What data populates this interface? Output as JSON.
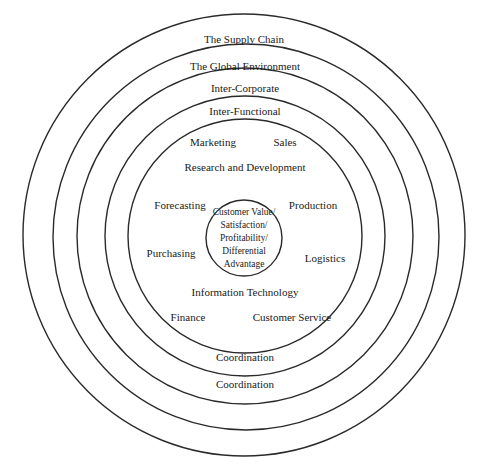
{
  "diagram": {
    "type": "concentric-circles",
    "stroke_color": "#2a2a2a",
    "rings": [
      {
        "name": "supply-chain",
        "label": "The Supply Chain",
        "cx": 244,
        "cy": 235,
        "r": 221
      },
      {
        "name": "global-environment",
        "label": "The Global Environment",
        "cx": 246,
        "cy": 237,
        "r": 193
      },
      {
        "name": "inter-corporate",
        "label": "Inter-Corporate",
        "cx": 245,
        "cy": 236,
        "r": 168
      },
      {
        "name": "inter-functional",
        "label": "Inter-Functional",
        "cx": 245,
        "cy": 236,
        "r": 140
      },
      {
        "name": "functions",
        "label": "",
        "cx": 245,
        "cy": 236,
        "r": 117
      },
      {
        "name": "core",
        "label": "",
        "cx": 244,
        "cy": 238,
        "r": 38
      }
    ],
    "ring_labels": {
      "supply_chain": "The Supply Chain",
      "global_environment": "The Global Environment",
      "inter_corporate": "Inter-Corporate",
      "inter_functional": "Inter-Functional",
      "coordination_inner": "Coordination",
      "coordination_outer": "Coordination"
    },
    "functions": {
      "marketing": "Marketing",
      "sales": "Sales",
      "research_development": "Research and Development",
      "forecasting": "Forecasting",
      "production": "Production",
      "purchasing": "Purchasing",
      "logistics": "Logistics",
      "information_technology": "Information Technology",
      "finance": "Finance",
      "customer_service": "Customer Service"
    },
    "core": {
      "lines": [
        "Customer Value/",
        "Satisfaction/",
        "Profitability/",
        "Differential",
        "Advantage"
      ]
    }
  }
}
